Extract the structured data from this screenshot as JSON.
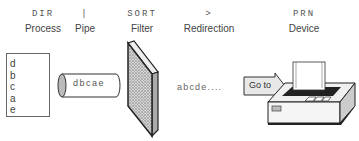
{
  "stages": [
    {
      "command": "DIR",
      "label": "Process",
      "x": 43
    },
    {
      "command": "|",
      "label": "Pipe",
      "x": 85
    },
    {
      "command": "SORT",
      "label": "Filter",
      "x": 142
    },
    {
      "command": ">",
      "label": "Redirection",
      "x": 209
    },
    {
      "command": "PRN",
      "label": "Device",
      "x": 304
    }
  ],
  "process_list": [
    "d",
    "b",
    "c",
    "a",
    "e"
  ],
  "pipe_content": "dbcae",
  "filter_output": "abcde....",
  "redirect_arrow_label": "Go to",
  "colors": {
    "stroke": "#222222",
    "filter_fill": "#cccccc",
    "text": "#444444"
  }
}
